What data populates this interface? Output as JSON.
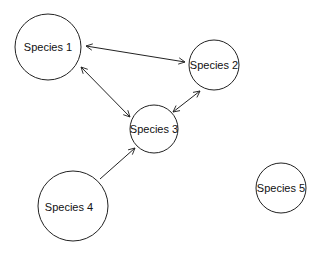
{
  "diagram": {
    "type": "species-interaction-network",
    "nodes": [
      {
        "id": "s1",
        "label": "Species 1",
        "cx": 48,
        "cy": 47,
        "r": 33
      },
      {
        "id": "s2",
        "label": "Species 2",
        "cx": 214,
        "cy": 65,
        "r": 25
      },
      {
        "id": "s3",
        "label": "Species 3",
        "cx": 154,
        "cy": 129,
        "r": 24
      },
      {
        "id": "s4",
        "label": "Species 4",
        "cx": 73,
        "cy": 206,
        "r": 35
      },
      {
        "id": "s5",
        "label": "Species 5",
        "cx": 281,
        "cy": 188,
        "r": 25
      }
    ],
    "edges": [
      {
        "from": "Species 1",
        "to": "Species 2",
        "direction": "bidirectional"
      },
      {
        "from": "Species 1",
        "to": "Species 3",
        "direction": "bidirectional"
      },
      {
        "from": "Species 3",
        "to": "Species 2",
        "direction": "bidirectional"
      },
      {
        "from": "Species 4",
        "to": "Species 3",
        "direction": "one-way"
      }
    ],
    "colors": {
      "stroke": "#222222",
      "background": "#ffffff"
    }
  }
}
